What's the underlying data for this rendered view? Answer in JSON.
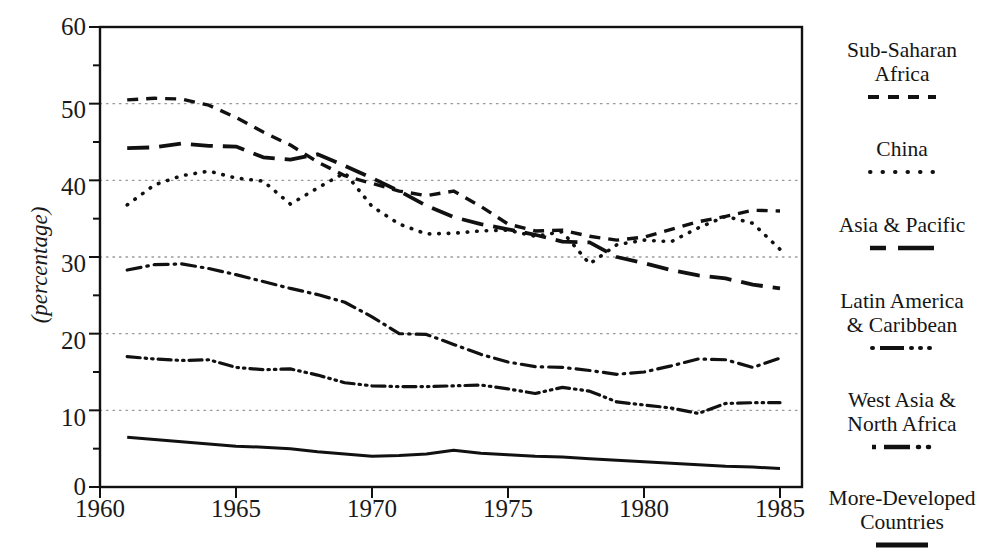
{
  "chart_data": {
    "type": "line",
    "title": "",
    "xlabel": "",
    "ylabel": "(percentage)",
    "xlim": [
      1960,
      1985
    ],
    "ylim": [
      0,
      60
    ],
    "yticks": [
      0,
      10,
      20,
      30,
      40,
      50,
      60
    ],
    "yticks_minor": [
      5,
      15,
      25,
      35,
      45,
      55
    ],
    "xticks": [
      1960,
      1965,
      1970,
      1975,
      1980,
      1985
    ],
    "grid": "horizontal-dotted",
    "legend_position": "right",
    "x": [
      1961,
      1962,
      1963,
      1964,
      1965,
      1966,
      1967,
      1968,
      1969,
      1970,
      1971,
      1972,
      1973,
      1974,
      1975,
      1976,
      1977,
      1978,
      1979,
      1980,
      1981,
      1982,
      1983,
      1984,
      1985
    ],
    "series": [
      {
        "name": "Sub-Saharan Africa",
        "style": "dashed",
        "values": [
          50.5,
          50.7,
          50.6,
          49.8,
          48.2,
          46.3,
          44.6,
          42.4,
          40.6,
          39.6,
          38.6,
          38.0,
          38.6,
          36.6,
          34.3,
          33.4,
          33.5,
          32.7,
          32.2,
          32.6,
          33.6,
          34.6,
          35.3,
          36.1,
          36.0
        ]
      },
      {
        "name": "China",
        "style": "dotted",
        "values": [
          36.8,
          39.4,
          40.6,
          41.2,
          40.3,
          39.9,
          36.9,
          39.0,
          41.0,
          36.6,
          34.3,
          33.0,
          33.1,
          33.4,
          33.5,
          32.7,
          33.3,
          29.1,
          31.6,
          32.2,
          32.0,
          33.8,
          35.3,
          34.4,
          31.0
        ]
      },
      {
        "name": "Asia & Pacific",
        "style": "longdash",
        "values": [
          44.2,
          44.3,
          44.8,
          44.5,
          44.4,
          43.0,
          42.7,
          43.4,
          41.9,
          40.3,
          38.6,
          36.7,
          35.2,
          34.3,
          33.6,
          32.9,
          32.0,
          31.9,
          30.0,
          29.2,
          28.3,
          27.6,
          27.2,
          26.4,
          25.9
        ]
      },
      {
        "name": "Latin America & Caribbean",
        "style": "dashdot",
        "values": [
          28.3,
          29.0,
          29.1,
          28.5,
          27.7,
          26.8,
          25.9,
          25.1,
          24.1,
          22.2,
          20.0,
          19.9,
          18.6,
          17.3,
          16.3,
          15.7,
          15.6,
          15.2,
          14.7,
          15.0,
          15.8,
          16.7,
          16.6,
          15.6,
          16.8
        ]
      },
      {
        "name": "West Asia & North Africa",
        "style": "dashdotdot",
        "values": [
          17.0,
          16.7,
          16.5,
          16.6,
          15.6,
          15.3,
          15.4,
          14.6,
          13.6,
          13.2,
          13.1,
          13.1,
          13.2,
          13.3,
          12.8,
          12.2,
          13.0,
          12.5,
          11.1,
          10.7,
          10.3,
          9.6,
          10.9,
          11.0,
          11.0
        ]
      },
      {
        "name": "More-Developed Countries",
        "style": "solid",
        "values": [
          6.5,
          6.2,
          5.9,
          5.6,
          5.3,
          5.2,
          5.0,
          4.6,
          4.3,
          4.0,
          4.1,
          4.3,
          4.8,
          4.4,
          4.2,
          4.0,
          3.9,
          3.7,
          3.5,
          3.3,
          3.1,
          2.9,
          2.7,
          2.6,
          2.4
        ]
      }
    ]
  },
  "axis": {
    "y_title": "(percentage)",
    "y_ticklabels": [
      "0",
      "10",
      "20",
      "30",
      "40",
      "50",
      "60"
    ],
    "x_ticklabels": [
      "1960",
      "1965",
      "1970",
      "1975",
      "1980",
      "1985"
    ]
  },
  "legend": {
    "items": [
      {
        "label": "Sub-Saharan\nAfrica",
        "swatch": "dashed-swatch"
      },
      {
        "label": "China",
        "swatch": "dotted-swatch"
      },
      {
        "label": "Asia & Pacific",
        "swatch": "longdash-swatch"
      },
      {
        "label": "Latin America\n& Caribbean",
        "swatch": "dashdot-swatch"
      },
      {
        "label": "West Asia &\nNorth Africa",
        "swatch": "dashdotdot-swatch"
      },
      {
        "label": "More-Developed\nCountries",
        "swatch": "solid-swatch"
      }
    ]
  },
  "colors": {
    "ink": "#111111",
    "grid": "#999999",
    "background": "#ffffff"
  }
}
